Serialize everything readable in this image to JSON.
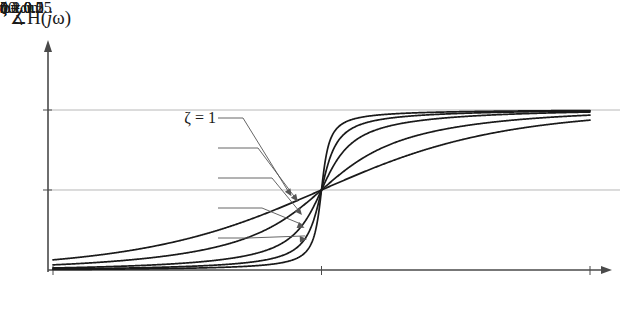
{
  "figure": {
    "y_axis_title": "∡H(",
    "y_axis_title_italic": "j",
    "y_axis_title_tail": "ω)",
    "x_axis_label": "ω"
  },
  "axes": {
    "y_ticks": [
      {
        "name": "pi",
        "label": "π",
        "value": 3.14159
      },
      {
        "name": "pi-half",
        "numerator": "π",
        "denominator": "2",
        "value": 1.5708
      },
      {
        "name": "zero",
        "label": "0",
        "value": 0
      }
    ],
    "x_ticks": [
      {
        "name": "left",
        "label": "0.1",
        "sub": "n",
        "unit": "ω",
        "value": 0.1
      },
      {
        "name": "mid",
        "label": "",
        "sub": "n",
        "unit": "ω",
        "value": 1.0
      },
      {
        "name": "right",
        "label": "10",
        "sub": "n",
        "unit": "ω",
        "value": 10.0
      }
    ]
  },
  "legend": {
    "items": [
      {
        "name": "zeta-1",
        "label": "ζ = 1",
        "zeta": 1.0
      },
      {
        "name": "zeta-0p5",
        "label": "ζ = 0.5",
        "zeta": 0.5
      },
      {
        "name": "zeta-0p2",
        "label": "ζ = 0.2",
        "zeta": 0.2
      },
      {
        "name": "zeta-0p1",
        "label": "ζ = 0.1",
        "zeta": 0.1
      },
      {
        "name": "zeta-0p05",
        "label": "ζ = 0.05",
        "zeta": 0.05
      }
    ]
  },
  "colors": {
    "curve": "#1a1a1a",
    "axis": "#4a4a4a",
    "gridline": "#b8b8b8",
    "leader": "#555555",
    "background": "#ffffff"
  },
  "chart_data": {
    "type": "line",
    "title": "",
    "xlabel": "ω",
    "ylabel": "∡H(jω)",
    "xscale": "log",
    "xlim": [
      0.1,
      10
    ],
    "ylim": [
      0,
      3.3
    ],
    "yticks": [
      0,
      1.5708,
      3.14159
    ],
    "ytick_labels": [
      "0",
      "π/2",
      "π"
    ],
    "xticks": [
      0.1,
      1,
      10
    ],
    "xtick_labels": [
      "0.1ωn",
      "ωn",
      "10ωn"
    ],
    "grid": "horizontal-at-yticks",
    "legend_position": "inside-left",
    "series": [
      {
        "name": "ζ = 1",
        "zeta": 1.0,
        "x": [
          0.1,
          0.1585,
          0.2512,
          0.3981,
          0.631,
          0.7943,
          1.0,
          1.2589,
          1.5849,
          2.512,
          3.981,
          6.31,
          10.0
        ],
        "y": [
          0.1987,
          0.3131,
          0.4899,
          0.7561,
          1.1268,
          1.3317,
          1.5708,
          1.8099,
          2.0148,
          2.3855,
          2.6517,
          2.8285,
          2.9429
        ]
      },
      {
        "name": "ζ = 0.5",
        "zeta": 0.5,
        "x": [
          0.1,
          0.1585,
          0.2512,
          0.3981,
          0.631,
          0.7943,
          1.0,
          1.2589,
          1.5849,
          2.512,
          3.981,
          6.31,
          10.0
        ],
        "y": [
          0.101,
          0.1614,
          0.2588,
          0.4185,
          0.6878,
          0.8771,
          1.5708,
          2.2637,
          2.453,
          2.7212,
          2.8812,
          2.9801,
          3.0405
        ]
      },
      {
        "name": "ζ = 0.2",
        "zeta": 0.2,
        "x": [
          0.1,
          0.1585,
          0.2512,
          0.3981,
          0.631,
          0.7943,
          1.0,
          1.2589,
          1.5849,
          2.512,
          3.981,
          6.31,
          10.0
        ],
        "y": [
          0.0404,
          0.0648,
          0.1043,
          0.1704,
          0.2872,
          0.3786,
          1.5708,
          2.7622,
          2.8536,
          2.9702,
          3.0372,
          3.0767,
          3.1011
        ]
      },
      {
        "name": "ζ = 0.1",
        "zeta": 0.1,
        "x": [
          0.1,
          0.1585,
          0.2512,
          0.3981,
          0.631,
          0.7943,
          1.0,
          1.2589,
          1.5849,
          2.512,
          3.981,
          6.31,
          10.0
        ],
        "y": [
          0.0202,
          0.0324,
          0.0522,
          0.0854,
          0.1447,
          0.1925,
          1.5708,
          2.9483,
          2.9968,
          3.0562,
          3.0894,
          3.1092,
          3.1213
        ]
      },
      {
        "name": "ζ = 0.05",
        "zeta": 0.05,
        "x": [
          0.1,
          0.1585,
          0.2512,
          0.3981,
          0.631,
          0.7943,
          1.0,
          1.2589,
          1.5849,
          2.512,
          3.981,
          6.31,
          10.0
        ],
        "y": [
          0.0101,
          0.0162,
          0.0261,
          0.0427,
          0.0726,
          0.0969,
          1.5708,
          3.0439,
          3.0689,
          3.0989,
          3.1155,
          3.1254,
          3.1315
        ]
      }
    ]
  }
}
